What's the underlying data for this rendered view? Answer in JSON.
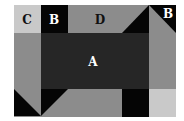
{
  "diagram": {
    "type": "tiled-region-figure",
    "frame": {
      "x": 14,
      "y": 5,
      "width": 162,
      "height": 112
    },
    "colors": {
      "background": "#ffffff",
      "mid_grey": "#8c8c8c",
      "dark_grey": "#262626",
      "black": "#050505",
      "light_grey": "#c9c9c9"
    },
    "labels": {
      "a": "A",
      "b_left": "B",
      "b_right": "B",
      "c": "C",
      "d": "D"
    }
  }
}
